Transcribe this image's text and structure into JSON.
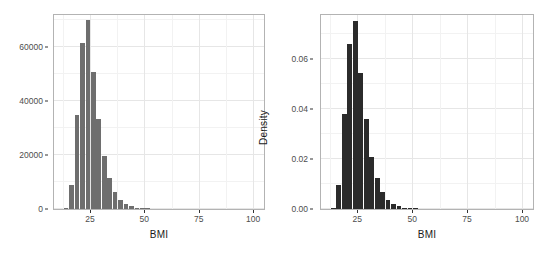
{
  "figure": {
    "background": "#ffffff",
    "panel_background": "#ffffff",
    "panel_border_color": "#b3b3b3",
    "grid_color": "#ebebeb"
  },
  "chart_data": [
    {
      "type": "bar",
      "id": "bmi-count-histogram",
      "title": "",
      "xlabel": "BMI",
      "ylabel": "Number of Individual",
      "xlim": [
        8.5,
        105
      ],
      "ylim": [
        0,
        72000
      ],
      "xticks": [
        25,
        50,
        75,
        100
      ],
      "xtick_labels": [
        "25",
        "50",
        "75",
        "100"
      ],
      "yticks": [
        0,
        20000,
        40000,
        60000
      ],
      "ytick_labels": [
        "0",
        "20000",
        "40000",
        "60000"
      ],
      "grid": true,
      "legend": "none",
      "bar_color": "#6e6e6e",
      "bin_width": 2.5,
      "bins": [
        {
          "x0": 13.0,
          "x1": 15.5,
          "value": 400
        },
        {
          "x0": 15.5,
          "x1": 18.0,
          "value": 9000
        },
        {
          "x0": 18.0,
          "x1": 20.5,
          "value": 35000
        },
        {
          "x0": 20.5,
          "x1": 23.0,
          "value": 61500
        },
        {
          "x0": 23.0,
          "x1": 25.5,
          "value": 70000
        },
        {
          "x0": 25.5,
          "x1": 28.0,
          "value": 51000
        },
        {
          "x0": 28.0,
          "x1": 30.5,
          "value": 33500
        },
        {
          "x0": 30.5,
          "x1": 33.0,
          "value": 19500
        },
        {
          "x0": 33.0,
          "x1": 35.5,
          "value": 11500
        },
        {
          "x0": 35.5,
          "x1": 38.0,
          "value": 6300
        },
        {
          "x0": 38.0,
          "x1": 40.5,
          "value": 3500
        },
        {
          "x0": 40.5,
          "x1": 43.0,
          "value": 2000
        },
        {
          "x0": 43.0,
          "x1": 45.5,
          "value": 1000
        },
        {
          "x0": 45.5,
          "x1": 48.0,
          "value": 500
        },
        {
          "x0": 48.0,
          "x1": 50.5,
          "value": 250
        },
        {
          "x0": 50.5,
          "x1": 53.0,
          "value": 120
        }
      ]
    },
    {
      "type": "bar",
      "id": "bmi-density-histogram",
      "title": "",
      "xlabel": "BMI",
      "ylabel": "Density",
      "xlim": [
        8.5,
        105
      ],
      "ylim": [
        0,
        0.0775
      ],
      "xticks": [
        25,
        50,
        75,
        100
      ],
      "xtick_labels": [
        "25",
        "50",
        "75",
        "100"
      ],
      "yticks": [
        0.0,
        0.02,
        0.04,
        0.06
      ],
      "ytick_labels": [
        "0.00",
        "0.02",
        "0.04",
        "0.06"
      ],
      "grid": true,
      "legend": "none",
      "bar_color": "#2b2b2b",
      "bin_width": 2.5,
      "bins": [
        {
          "x0": 13.0,
          "x1": 15.5,
          "value": 0.0005
        },
        {
          "x0": 15.5,
          "x1": 18.0,
          "value": 0.0095
        },
        {
          "x0": 18.0,
          "x1": 20.5,
          "value": 0.0378
        },
        {
          "x0": 20.5,
          "x1": 23.0,
          "value": 0.066
        },
        {
          "x0": 23.0,
          "x1": 25.5,
          "value": 0.075
        },
        {
          "x0": 25.5,
          "x1": 28.0,
          "value": 0.0545
        },
        {
          "x0": 28.0,
          "x1": 30.5,
          "value": 0.0358
        },
        {
          "x0": 30.5,
          "x1": 33.0,
          "value": 0.0208
        },
        {
          "x0": 33.0,
          "x1": 35.5,
          "value": 0.0122
        },
        {
          "x0": 35.5,
          "x1": 38.0,
          "value": 0.0068
        },
        {
          "x0": 38.0,
          "x1": 40.5,
          "value": 0.0038
        },
        {
          "x0": 40.5,
          "x1": 43.0,
          "value": 0.0021
        },
        {
          "x0": 43.0,
          "x1": 45.5,
          "value": 0.0011
        },
        {
          "x0": 45.5,
          "x1": 48.0,
          "value": 0.0006
        },
        {
          "x0": 48.0,
          "x1": 50.5,
          "value": 0.0003
        },
        {
          "x0": 50.5,
          "x1": 53.0,
          "value": 0.00012
        }
      ]
    }
  ]
}
